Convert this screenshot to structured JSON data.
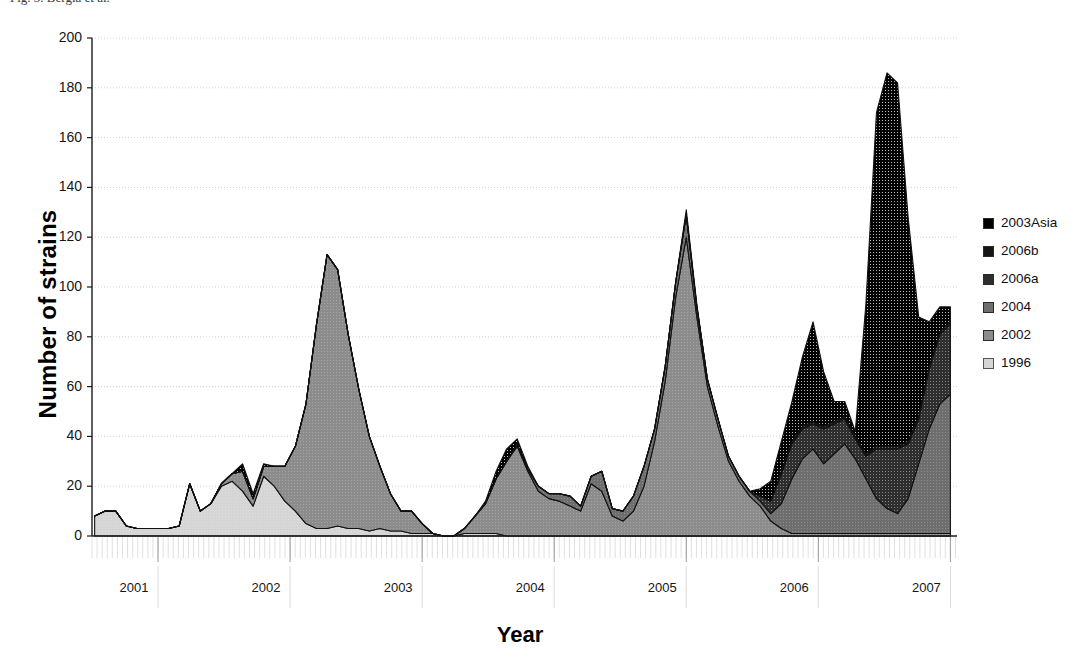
{
  "caption": "Fig. 3. Bergia et al.",
  "axes": {
    "ylabel": "Number of strains",
    "xlabel": "Year",
    "yticks": [
      "0",
      "20",
      "40",
      "60",
      "80",
      "100",
      "120",
      "140",
      "160",
      "180",
      "200"
    ],
    "xticks": [
      "2001",
      "2002",
      "2003",
      "2004",
      "2005",
      "2006",
      "2007"
    ]
  },
  "legend": {
    "items": [
      {
        "label": "2003Asia",
        "color": "#000000"
      },
      {
        "label": "2006b",
        "color": "#151515"
      },
      {
        "label": "2006a",
        "color": "#2e2e2e"
      },
      {
        "label": "2004",
        "color": "#6e6e6e"
      },
      {
        "label": "2002",
        "color": "#8c8c8c"
      },
      {
        "label": "1996",
        "color": "#d5d5d5"
      }
    ]
  },
  "chart_data": {
    "type": "area",
    "stacked": true,
    "title": "",
    "subtitle": "",
    "xlabel": "Year",
    "ylabel": "Number of strains",
    "ylim": [
      0,
      200
    ],
    "xlim": [
      2000.5,
      2007.05
    ],
    "grid": true,
    "legend_position": "right",
    "x_tick_values": [
      2001,
      2002,
      2003,
      2004,
      2005,
      2006,
      2007
    ],
    "minor_ticks_per_year": 26,
    "x": [
      2000.52,
      2000.6,
      2000.68,
      2000.76,
      2000.84,
      2000.92,
      2001.0,
      2001.08,
      2001.16,
      2001.24,
      2001.32,
      2001.4,
      2001.48,
      2001.56,
      2001.64,
      2001.72,
      2001.8,
      2001.88,
      2001.96,
      2002.04,
      2002.12,
      2002.2,
      2002.28,
      2002.36,
      2002.44,
      2002.52,
      2002.6,
      2002.68,
      2002.76,
      2002.84,
      2002.92,
      2003.0,
      2003.08,
      2003.16,
      2003.24,
      2003.32,
      2003.4,
      2003.48,
      2003.56,
      2003.64,
      2003.72,
      2003.8,
      2003.88,
      2003.96,
      2004.04,
      2004.12,
      2004.2,
      2004.28,
      2004.36,
      2004.44,
      2004.52,
      2004.6,
      2004.68,
      2004.76,
      2004.84,
      2004.92,
      2005.0,
      2005.08,
      2005.16,
      2005.24,
      2005.32,
      2005.4,
      2005.48,
      2005.56,
      2005.64,
      2005.72,
      2005.8,
      2005.88,
      2005.96,
      2006.04,
      2006.12,
      2006.2,
      2006.28,
      2006.36,
      2006.44,
      2006.52,
      2006.6,
      2006.68,
      2006.76,
      2006.84,
      2006.92,
      2007.0
    ],
    "series": [
      {
        "name": "1996",
        "color": "#d5d5d5",
        "values": [
          8,
          10,
          10,
          4,
          3,
          3,
          3,
          3,
          4,
          21,
          10,
          13,
          20,
          22,
          18,
          12,
          24,
          20,
          14,
          10,
          5,
          3,
          3,
          4,
          3,
          3,
          2,
          3,
          2,
          2,
          1,
          1,
          1,
          0,
          0,
          1,
          1,
          1,
          1,
          0,
          0,
          0,
          0,
          0,
          0,
          0,
          0,
          0,
          0,
          0,
          0,
          0,
          0,
          0,
          0,
          0,
          0,
          0,
          0,
          0,
          0,
          0,
          0,
          0,
          0,
          0,
          0,
          0,
          0,
          0,
          0,
          0,
          0,
          0,
          0,
          0,
          0,
          0,
          0,
          0,
          0,
          0
        ]
      },
      {
        "name": "2002",
        "color": "#8c8c8c",
        "values": [
          0,
          0,
          0,
          0,
          0,
          0,
          0,
          0,
          0,
          0,
          0,
          0,
          1,
          3,
          8,
          3,
          4,
          8,
          14,
          26,
          48,
          82,
          110,
          103,
          78,
          56,
          38,
          25,
          15,
          8,
          9,
          4,
          0,
          0,
          0,
          2,
          7,
          12,
          22,
          30,
          36,
          26,
          18,
          15,
          14,
          12,
          10,
          21,
          18,
          8,
          6,
          10,
          20,
          38,
          62,
          96,
          120,
          88,
          60,
          44,
          30,
          22,
          16,
          12,
          6,
          3,
          1,
          1,
          1,
          1,
          1,
          1,
          1,
          1,
          1,
          1,
          1,
          1,
          1,
          1,
          1,
          1
        ]
      },
      {
        "name": "2004",
        "color": "#6e6e6e",
        "values": [
          0,
          0,
          0,
          0,
          0,
          0,
          0,
          0,
          0,
          0,
          0,
          0,
          0,
          0,
          0,
          0,
          0,
          0,
          0,
          0,
          0,
          0,
          0,
          0,
          0,
          0,
          0,
          0,
          0,
          0,
          0,
          0,
          0,
          0,
          0,
          0,
          0,
          0,
          0,
          0,
          1,
          1,
          2,
          2,
          3,
          4,
          2,
          3,
          8,
          3,
          4,
          6,
          8,
          5,
          6,
          6,
          9,
          4,
          3,
          3,
          2,
          2,
          2,
          2,
          3,
          10,
          22,
          30,
          34,
          28,
          32,
          36,
          30,
          22,
          14,
          10,
          8,
          14,
          28,
          42,
          52,
          56
        ]
      },
      {
        "name": "2006a",
        "color": "#2e2e2e",
        "values": [
          0,
          0,
          0,
          0,
          0,
          0,
          0,
          0,
          0,
          0,
          0,
          0,
          0,
          0,
          0,
          0,
          0,
          0,
          0,
          0,
          0,
          0,
          0,
          0,
          0,
          0,
          0,
          0,
          0,
          0,
          0,
          0,
          0,
          0,
          0,
          0,
          0,
          0,
          0,
          0,
          0,
          0,
          0,
          0,
          0,
          0,
          0,
          0,
          0,
          0,
          0,
          0,
          0,
          0,
          0,
          0,
          0,
          0,
          0,
          0,
          0,
          0,
          0,
          2,
          5,
          12,
          14,
          12,
          10,
          14,
          12,
          10,
          8,
          9,
          20,
          24,
          26,
          22,
          18,
          24,
          28,
          28
        ]
      },
      {
        "name": "2006b",
        "color": "#151515",
        "values": [
          0,
          0,
          0,
          0,
          0,
          0,
          0,
          0,
          0,
          0,
          0,
          0,
          0,
          0,
          0,
          0,
          0,
          0,
          0,
          0,
          0,
          0,
          0,
          0,
          0,
          0,
          0,
          0,
          0,
          0,
          0,
          0,
          0,
          0,
          0,
          0,
          0,
          0,
          0,
          0,
          0,
          0,
          0,
          0,
          0,
          0,
          0,
          0,
          0,
          0,
          0,
          0,
          0,
          0,
          0,
          0,
          0,
          0,
          0,
          0,
          0,
          0,
          0,
          0,
          0,
          1,
          1,
          1,
          1,
          1,
          1,
          1,
          1,
          1,
          1,
          1,
          1,
          1,
          1,
          1,
          1,
          1
        ]
      },
      {
        "name": "2003Asia",
        "color": "#000000",
        "values": [
          0,
          0,
          0,
          0,
          0,
          0,
          0,
          0,
          0,
          0,
          0,
          0,
          0,
          0,
          3,
          2,
          1,
          0,
          0,
          0,
          0,
          0,
          0,
          0,
          0,
          0,
          0,
          0,
          0,
          0,
          0,
          0,
          0,
          0,
          0,
          0,
          0,
          1,
          3,
          5,
          2,
          1,
          0,
          0,
          0,
          0,
          0,
          0,
          0,
          0,
          0,
          0,
          0,
          0,
          0,
          0,
          2,
          1,
          0,
          0,
          0,
          0,
          0,
          3,
          8,
          12,
          16,
          28,
          40,
          22,
          8,
          6,
          2,
          60,
          134,
          150,
          146,
          90,
          40,
          18,
          10,
          6
        ]
      }
    ],
    "annotations": {
      "peaks": [
        {
          "label": "2002 peak",
          "x": 2002.28,
          "y": 113
        },
        {
          "label": "2003 peak",
          "x": 2003.64,
          "y": 37
        },
        {
          "label": "2004/05 peak",
          "x": 2005.0,
          "y": 122
        },
        {
          "label": "2006 peak",
          "x": 2005.96,
          "y": 84
        },
        {
          "label": "2006/07 peak",
          "x": 2006.52,
          "y": 181
        }
      ]
    }
  }
}
